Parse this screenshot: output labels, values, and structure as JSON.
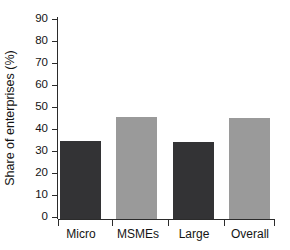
{
  "chart_data": {
    "type": "bar",
    "title": "",
    "subtitle": "",
    "xlabel": "",
    "ylabel": "Share of enterprises (%)",
    "categories": [
      "Micro",
      "MSMEs",
      "Large",
      "Overall"
    ],
    "values": [
      53,
      48,
      35,
      46
    ],
    "series": [
      {
        "name": "Share of enterprises",
        "values": [
          53,
          48,
          35,
          46
        ]
      }
    ],
    "bar_colors": [
      "#333335",
      "#333335",
      "#333335",
      "#9a9a9a"
    ],
    "ylim": [
      0,
      90
    ],
    "yticks": [
      0,
      10,
      20,
      30,
      40,
      50,
      60,
      70,
      80,
      90
    ],
    "ytick_labels": [
      "0",
      "10",
      "20",
      "30",
      "40",
      "50",
      "60",
      "70",
      "80",
      "90"
    ],
    "grid": false,
    "legend": false,
    "legend_position": "none",
    "axis_color": "#2b2b2b",
    "background_color": "#ffffff"
  },
  "annotations": {
    "note": ""
  }
}
